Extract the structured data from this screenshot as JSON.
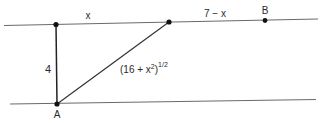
{
  "diagram": {
    "type": "geometry-figure",
    "labels": {
      "segment_top_left": "x",
      "segment_top_right": "7 − x",
      "point_B": "B",
      "vertical_length": "4",
      "hypotenuse_base": "(16 + x",
      "hypotenuse_sup2": "2",
      "hypotenuse_close": ")",
      "hypotenuse_exp": "1/2",
      "point_A": "A"
    },
    "colors": {
      "line": "#555555",
      "heavy_line": "#222222",
      "point": "#111111"
    }
  }
}
